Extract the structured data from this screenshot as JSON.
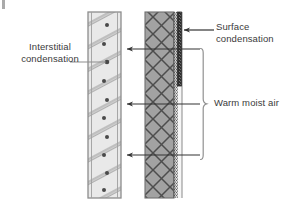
{
  "figure": {
    "type": "building-science-wall-condensation-diagram",
    "background_color": "#ffffff"
  },
  "labels": {
    "interstitial": "Interstitial\ncondensation",
    "surface": "Surface\ncondensation",
    "warm_air": "Warm moist air"
  },
  "walls": {
    "left": {
      "name": "left-wall-section",
      "x": 88,
      "y": 12,
      "width": 33,
      "height": 186,
      "fill_color": "#e8e8e8",
      "border_color": "#8a8a8a",
      "hatch_color": "#9a9a9a",
      "dot_color": "#4a4a4a",
      "hatch_style": "diagonal-double-lines",
      "dot_count": 10
    },
    "right": {
      "name": "right-wall-section",
      "x": 145,
      "y": 12,
      "width": 36,
      "height": 186,
      "fill_color": "#a0a0a0",
      "border_color": "#6e6e6e",
      "hatch_color": "#4f4f4f",
      "hatch_style": "cross-hatch-diamond",
      "inner_layer": {
        "x": 174,
        "width": 4,
        "fill_color": "#d8d8d8",
        "dotted_color": "#5a5a5a"
      },
      "cavity": {
        "x": 178,
        "width": 4,
        "fill_color": "#f4f4f4"
      }
    }
  },
  "condensation_bar": {
    "name": "surface-condensation-bar",
    "x": 177,
    "y": 12,
    "width": 4,
    "height": 74,
    "fill_color": "#3a3a3a"
  },
  "arrows": {
    "moisture_flow": [
      {
        "name": "moisture-arrow-top",
        "y": 49,
        "x_start": 200,
        "x_end": 126
      },
      {
        "name": "moisture-arrow-middle",
        "y": 104,
        "x_start": 200,
        "x_end": 126
      },
      {
        "name": "moisture-arrow-bottom",
        "y": 155,
        "x_start": 200,
        "x_end": 126
      }
    ],
    "surface": {
      "name": "surface-condensation-arrow",
      "y": 30,
      "x_start": 214,
      "x_end": 182
    },
    "interstitial": {
      "name": "interstitial-condensation-leader",
      "y": 62,
      "x_start": 70,
      "x_end": 108
    },
    "color": "#333333"
  },
  "brace": {
    "name": "warm-moist-air-brace",
    "x": 203,
    "y_top": 48,
    "y_bottom": 160,
    "tip_y": 104,
    "color": "#8f8f8f"
  }
}
